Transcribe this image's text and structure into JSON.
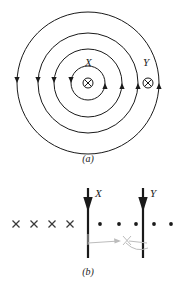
{
  "figure": {
    "kind": "physics-field-diagram",
    "background_color": "#ffffff",
    "ink_color": "#1a1a1a",
    "annotation_color": "#b9b9b9",
    "panel_a": {
      "caption": "(a)",
      "caption_x": 88,
      "caption_y": 160,
      "description": "Concentric magnetic field circles around a current-carrying wire going into the page",
      "center": {
        "x": 88,
        "y": 83
      },
      "circles": [
        {
          "radius": 17,
          "arrow_left_angle": 180,
          "arrow_right_angle": 0
        },
        {
          "radius": 34,
          "arrow_left_angle": 180,
          "arrow_right_angle": 0
        },
        {
          "radius": 50,
          "arrow_left_angle": 180,
          "arrow_right_angle": 0
        },
        {
          "radius": 71,
          "arrow_left_angle": 180,
          "arrow_right_angle": 0
        }
      ],
      "points": [
        {
          "id": "center-current",
          "symbol": "circled-x",
          "x": 88,
          "y": 83,
          "radius": 5
        },
        {
          "id": "point-Y-current",
          "symbol": "circled-x",
          "x": 148,
          "y": 83,
          "radius": 5
        }
      ],
      "labels": [
        {
          "id": "label-X",
          "text": "X",
          "x": 85,
          "y": 62
        },
        {
          "id": "label-Y",
          "text": "Y",
          "x": 143,
          "y": 62
        }
      ]
    },
    "panel_b": {
      "caption": "(b)",
      "caption_x": 88,
      "caption_y": 273,
      "description": "Side view: downward current arrows at X and Y, field into page on the left (crosses) and out of page on the right (dots)",
      "baseline_y": 224,
      "arrows": [
        {
          "id": "arrow-X",
          "x": 88,
          "y_top": 188,
          "y_bottom": 258,
          "label": "X",
          "label_x": 95,
          "label_y": 196
        },
        {
          "id": "arrow-Y",
          "x": 143,
          "y_top": 188,
          "y_bottom": 258,
          "label": "Y",
          "label_x": 150,
          "label_y": 196
        }
      ],
      "crosses": [
        {
          "x": 16,
          "y": 224
        },
        {
          "x": 34,
          "y": 224
        },
        {
          "x": 52,
          "y": 224
        },
        {
          "x": 70,
          "y": 224
        }
      ],
      "dots": [
        {
          "x": 100,
          "y": 224
        },
        {
          "x": 119,
          "y": 224
        },
        {
          "x": 136,
          "y": 224
        },
        {
          "x": 154,
          "y": 224
        },
        {
          "x": 171,
          "y": 224
        }
      ],
      "hand_annotation": {
        "id": "pencil-annotation",
        "present": true,
        "color": "#b9b9b9",
        "elements": [
          {
            "type": "right-arrow",
            "x1": 90,
            "y1": 243,
            "x2": 120,
            "y2": 241
          },
          {
            "type": "small-cross",
            "x": 127,
            "y": 240,
            "size": 8
          },
          {
            "type": "arc-arrow",
            "x1": 130,
            "y1": 244,
            "x2": 147,
            "y2": 249
          }
        ]
      }
    }
  }
}
